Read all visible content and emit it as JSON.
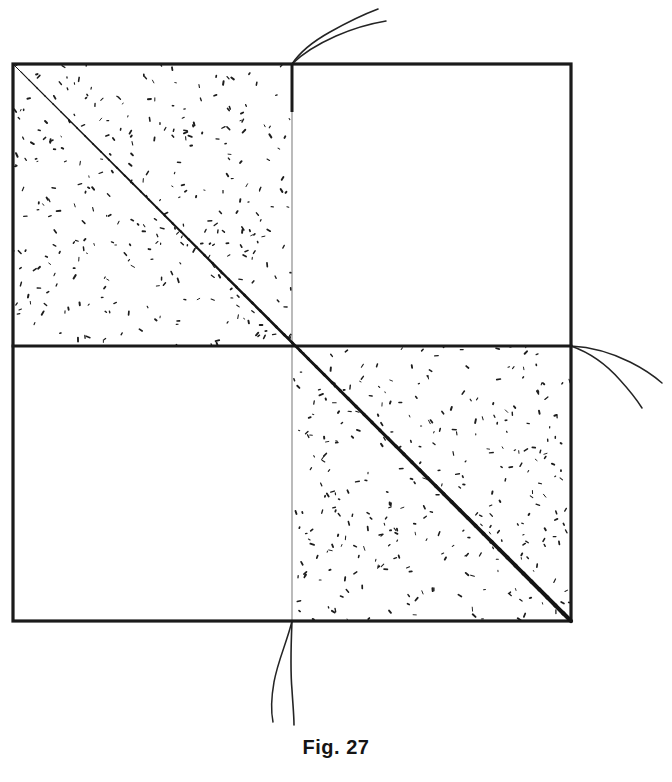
{
  "figure": {
    "caption": "Fig. 27",
    "title": "Fig. 27",
    "kind": "line-drawing",
    "background_color": "#ffffff",
    "ink_color": "#1a1a1a",
    "faint_ink_color": "#9a9a9a"
  },
  "geometry": {
    "square": {
      "left": 13,
      "top": 64,
      "right": 571,
      "bottom": 621,
      "width": 558,
      "height": 557,
      "stroke_width": 3.2,
      "stroke_color": "#1a1a1a"
    },
    "center": {
      "x": 292,
      "y": 346
    },
    "center_vertical_line": {
      "x": 292,
      "y_top": 64,
      "y_bottom": 621,
      "stroke_width": 1.2,
      "stroke_color": "#8d8d8d",
      "dark_head_to_y": 112,
      "dark_stroke_width": 3.0
    },
    "center_horizontal_line": {
      "y": 346,
      "x_left": 13,
      "x_right": 571,
      "stroke_width": 2.8,
      "stroke_color": "#1a1a1a"
    },
    "diagonal": {
      "from": {
        "x": 13,
        "y": 64
      },
      "to": {
        "x": 571,
        "y": 621
      },
      "stroke_color": "#1a1a1a",
      "stroke_width_start": 1.0,
      "stroke_width_end": 4.2
    },
    "stippled_quadrants": [
      "upper-left",
      "lower-right"
    ],
    "plain_quadrants": [
      "upper-right",
      "lower-left"
    ],
    "stipple": {
      "mark_color": "#1c1c1c",
      "mark_count_per_quadrant": 320,
      "mark_length_px": [
        1,
        4
      ]
    }
  },
  "threads": [
    {
      "id": "thread-top",
      "anchor": {
        "x": 292,
        "y": 64
      },
      "direction": "up-right",
      "strand_count": 2,
      "extent_px": 56
    },
    {
      "id": "thread-right",
      "anchor": {
        "x": 571,
        "y": 346
      },
      "direction": "down-right",
      "strand_count": 2,
      "extent_px": 100
    },
    {
      "id": "thread-bottom",
      "anchor": {
        "x": 292,
        "y": 621
      },
      "direction": "down",
      "strand_count": 2,
      "extent_px": 104
    }
  ]
}
